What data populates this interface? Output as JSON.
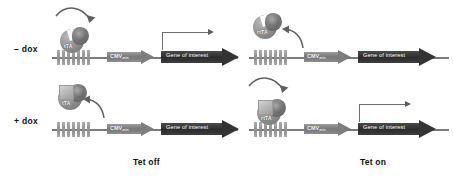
{
  "figure": {
    "colors": {
      "tre_repeat": "#8f8f8f",
      "cmv_arrow": "#7d7d7d",
      "gene_arrow": "#333333",
      "protein": "#808080",
      "dox_molecule": "#b4b4b4",
      "transcription_arrow": "#6d6d6d",
      "text": "#111111",
      "background": "#ffffff"
    }
  },
  "elements": {
    "cmv_label": "CMV",
    "cmv_subscript": "min",
    "gene_label": "Gene of interest",
    "tre_repeat_count": 7
  },
  "panels": [
    {
      "id": "tet-off-minus-dox",
      "system": "Tet off",
      "condition": "– dox",
      "protein": "tTA",
      "protein_bound_to_dna": true,
      "dox_bound_to_protein": false,
      "transcription_active": true,
      "arrow_direction": "binding"
    },
    {
      "id": "tet-off-plus-dox",
      "system": "Tet off",
      "condition": "+ dox",
      "protein": "tTA",
      "protein_bound_to_dna": false,
      "dox_bound_to_protein": true,
      "transcription_active": false,
      "arrow_direction": "release"
    },
    {
      "id": "tet-on-minus-dox",
      "system": "Tet on",
      "condition": "– dox",
      "protein": "rtTA",
      "protein_bound_to_dna": false,
      "dox_bound_to_protein": false,
      "transcription_active": false,
      "arrow_direction": "release"
    },
    {
      "id": "tet-on-plus-dox",
      "system": "Tet on",
      "condition": "+ dox",
      "protein": "rtTA",
      "protein_bound_to_dna": true,
      "dox_bound_to_protein": true,
      "transcription_active": true,
      "arrow_direction": "binding"
    }
  ],
  "captions": {
    "left": "Tet off",
    "right": "Tet on"
  }
}
